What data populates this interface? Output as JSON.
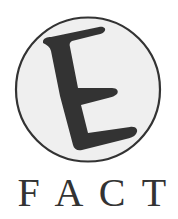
{
  "logo": {
    "emblem_letter": "E",
    "wordmark": "FACT",
    "wordmark_letters": [
      "F",
      "A",
      "C",
      "T"
    ]
  },
  "colors": {
    "background": "#ffffff",
    "circle_fill": "#efefef",
    "ink": "#333333"
  }
}
